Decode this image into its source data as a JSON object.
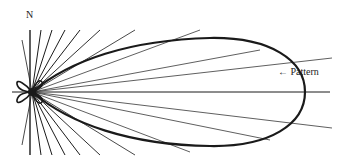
{
  "diagram": {
    "labels": {
      "north": "N",
      "pattern": "← Pattern"
    },
    "colors": {
      "ink": "#1a1a1a",
      "background": "#ffffff"
    },
    "origin": {
      "x": 32,
      "y": 92
    },
    "main_lobe": {
      "direction": "east",
      "tip_x": 305,
      "top_y": 40,
      "bottom_y": 145
    },
    "side_lobes": [
      "upper-left",
      "lower-left",
      "upper-right small",
      "lower-right small"
    ],
    "radial_lines_count": 26
  }
}
